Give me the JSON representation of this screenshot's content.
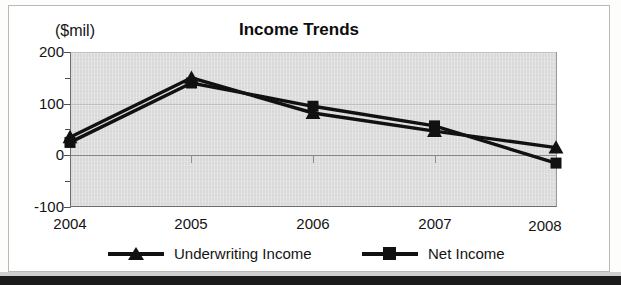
{
  "chart_data": {
    "type": "line",
    "title": "Income Trends",
    "unit_label": "($mil)",
    "xlabel": "",
    "ylabel": "($mil)",
    "categories": [
      "2004",
      "2005",
      "2006",
      "2007",
      "2008"
    ],
    "ylim": [
      -100,
      200
    ],
    "yticks": [
      -100,
      0,
      100,
      200
    ],
    "yticklabels": [
      "-100",
      "0",
      "100",
      "200"
    ],
    "yminorticks": [
      -50,
      50,
      150
    ],
    "grid": true,
    "legend_position": "bottom",
    "series": [
      {
        "name": "Underwriting Income",
        "marker": "triangle",
        "color": "#111111",
        "values": [
          35,
          150,
          82,
          47,
          15
        ]
      },
      {
        "name": "Net Income",
        "marker": "square",
        "color": "#111111",
        "values": [
          25,
          140,
          95,
          57,
          -15
        ]
      }
    ]
  },
  "legend": {
    "items": [
      {
        "label": "Underwriting Income",
        "marker": "triangle-marker"
      },
      {
        "label": "Net Income",
        "marker": "square-marker"
      }
    ]
  },
  "colors": {
    "plot_background": "#d9d9d9",
    "series": "#111111",
    "gridline": "#c0c0c0",
    "page_background": "#ffffff"
  }
}
